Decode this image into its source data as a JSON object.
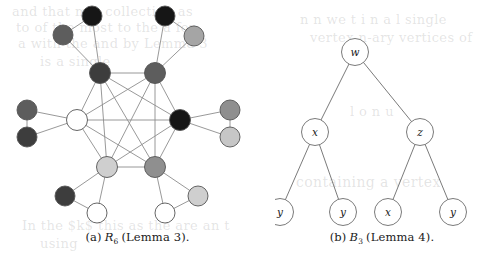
{
  "page": {
    "background": "#ffffff",
    "width": 489,
    "height": 262
  },
  "figure_a": {
    "caption_prefix": "(a)",
    "caption_symbol": "R",
    "caption_subscript": "6",
    "caption_suffix": "(Lemma 3).",
    "colors": {
      "black": "#161616",
      "dark_gray": "#4a4a4a",
      "mid_gray": "#7d7d7d",
      "light_gray": "#c8c8c8",
      "white": "#ffffff",
      "outline": "#555555",
      "edge": "#8d8d8d"
    },
    "description": "R6 graph: inner K6 clique with pendant pairs",
    "nodes": [
      {
        "id": "c1",
        "x": 100,
        "y": 73,
        "r": 10.5,
        "fill": "#3d3d3d",
        "group": "inner"
      },
      {
        "id": "c2",
        "x": 155,
        "y": 73,
        "r": 10.5,
        "fill": "#5d5d5d",
        "group": "inner"
      },
      {
        "id": "c3",
        "x": 180,
        "y": 120,
        "r": 10.5,
        "fill": "#161616",
        "group": "inner"
      },
      {
        "id": "c4",
        "x": 155,
        "y": 167,
        "r": 10.5,
        "fill": "#8f8f8f",
        "group": "inner"
      },
      {
        "id": "c5",
        "x": 107,
        "y": 167,
        "r": 10.5,
        "fill": "#cfcfcf",
        "group": "inner"
      },
      {
        "id": "c6",
        "x": 77,
        "y": 120,
        "r": 10.5,
        "fill": "#ffffff",
        "group": "inner"
      },
      {
        "id": "p1a",
        "x": 92,
        "y": 16,
        "r": 10.0,
        "fill": "#161616",
        "group": "outer"
      },
      {
        "id": "p1b",
        "x": 63,
        "y": 35,
        "r": 10.0,
        "fill": "#5d5d5d",
        "group": "outer"
      },
      {
        "id": "p2a",
        "x": 165,
        "y": 16,
        "r": 10.0,
        "fill": "#161616",
        "group": "outer"
      },
      {
        "id": "p2b",
        "x": 194,
        "y": 36,
        "r": 10.0,
        "fill": "#a5a5a5",
        "group": "outer"
      },
      {
        "id": "p3a",
        "x": 230,
        "y": 110,
        "r": 10.0,
        "fill": "#8f8f8f",
        "group": "outer"
      },
      {
        "id": "p3b",
        "x": 230,
        "y": 137,
        "r": 10.0,
        "fill": "#c6c6c6",
        "group": "outer"
      },
      {
        "id": "p4a",
        "x": 198,
        "y": 196,
        "r": 10.0,
        "fill": "#cfcfcf",
        "group": "outer"
      },
      {
        "id": "p4b",
        "x": 165,
        "y": 213,
        "r": 10.0,
        "fill": "#ffffff",
        "group": "outer"
      },
      {
        "id": "p5a",
        "x": 65,
        "y": 196,
        "r": 10.0,
        "fill": "#3d3d3d",
        "group": "outer"
      },
      {
        "id": "p5b",
        "x": 97,
        "y": 213,
        "r": 10.0,
        "fill": "#ffffff",
        "group": "outer"
      },
      {
        "id": "p6a",
        "x": 27,
        "y": 110,
        "r": 10.0,
        "fill": "#5d5d5d",
        "group": "outer"
      },
      {
        "id": "p6b",
        "x": 27,
        "y": 137,
        "r": 10.0,
        "fill": "#3d3d3d",
        "group": "outer"
      }
    ],
    "edges": [
      [
        "c1",
        "c2"
      ],
      [
        "c1",
        "c3"
      ],
      [
        "c1",
        "c4"
      ],
      [
        "c1",
        "c5"
      ],
      [
        "c1",
        "c6"
      ],
      [
        "c2",
        "c3"
      ],
      [
        "c2",
        "c4"
      ],
      [
        "c2",
        "c5"
      ],
      [
        "c2",
        "c6"
      ],
      [
        "c3",
        "c4"
      ],
      [
        "c3",
        "c5"
      ],
      [
        "c3",
        "c6"
      ],
      [
        "c4",
        "c5"
      ],
      [
        "c4",
        "c6"
      ],
      [
        "c5",
        "c6"
      ],
      [
        "c1",
        "p1a"
      ],
      [
        "c1",
        "p1b"
      ],
      [
        "p1a",
        "p1b"
      ],
      [
        "c2",
        "p2a"
      ],
      [
        "c2",
        "p2b"
      ],
      [
        "p2a",
        "p2b"
      ],
      [
        "c3",
        "p3a"
      ],
      [
        "c3",
        "p3b"
      ],
      [
        "p3a",
        "p3b"
      ],
      [
        "c4",
        "p4a"
      ],
      [
        "c4",
        "p4b"
      ],
      [
        "p4a",
        "p4b"
      ],
      [
        "c5",
        "p5a"
      ],
      [
        "c5",
        "p5b"
      ],
      [
        "p5a",
        "p5b"
      ],
      [
        "c6",
        "p6a"
      ],
      [
        "c6",
        "p6b"
      ],
      [
        "p6a",
        "p6b"
      ]
    ]
  },
  "figure_b": {
    "caption_prefix": "(b)",
    "caption_symbol": "B",
    "caption_subscript": "3",
    "caption_suffix": "(Lemma 4).",
    "colors": {
      "node_fill": "#ffffff",
      "node_stroke": "#6b6b6b",
      "edge": "#6b6b6b",
      "label": "#1a1a1a"
    },
    "description": "B3 binary tree with labelled nodes",
    "nodes": [
      {
        "id": "root",
        "label": "w",
        "x": 80,
        "y": 52,
        "r": 13.5
      },
      {
        "id": "left",
        "label": "x",
        "x": 40,
        "y": 132,
        "r": 13.5
      },
      {
        "id": "right",
        "label": "z",
        "x": 145,
        "y": 132,
        "r": 13.5
      },
      {
        "id": "ll",
        "label": "y",
        "x": 5,
        "y": 212,
        "r": 13.5
      },
      {
        "id": "lr",
        "label": "y",
        "x": 68,
        "y": 212,
        "r": 13.5
      },
      {
        "id": "rl",
        "label": "x",
        "x": 113,
        "y": 212,
        "r": 13.5
      },
      {
        "id": "rr",
        "label": "y",
        "x": 178,
        "y": 212,
        "r": 13.5
      }
    ],
    "edges": [
      [
        "root",
        "left"
      ],
      [
        "root",
        "right"
      ],
      [
        "left",
        "ll"
      ],
      [
        "left",
        "lr"
      ],
      [
        "right",
        "rl"
      ],
      [
        "right",
        "rr"
      ]
    ]
  },
  "background_ghost_text": [
    {
      "text": "and  that  my)  collection  as",
      "x": 12,
      "y": 4,
      "size": 13
    },
    {
      "text": "to  of  the  most  to  the  a  for",
      "x": 16,
      "y": 20,
      "size": 13
    },
    {
      "text": "a  with  the  and  by  Lemma 3",
      "x": 18,
      "y": 36,
      "size": 13
    },
    {
      "text": "is  a  single",
      "x": 40,
      "y": 54,
      "size": 13
    },
    {
      "text": "In  the  $k$  this  as  the  are  an  t",
      "x": 22,
      "y": 218,
      "size": 13
    },
    {
      "text": "using",
      "x": 40,
      "y": 236,
      "size": 13
    },
    {
      "text": "n  n  we  t  i  n  a  l  single",
      "x": 300,
      "y": 12,
      "size": 13
    },
    {
      "text": "vertex  n-ary  vertices  of",
      "x": 310,
      "y": 30,
      "size": 13
    },
    {
      "text": "l  o  n  u",
      "x": 350,
      "y": 104,
      "size": 13
    },
    {
      "text": "containing  a  vertex",
      "x": 296,
      "y": 174,
      "size": 14
    }
  ]
}
